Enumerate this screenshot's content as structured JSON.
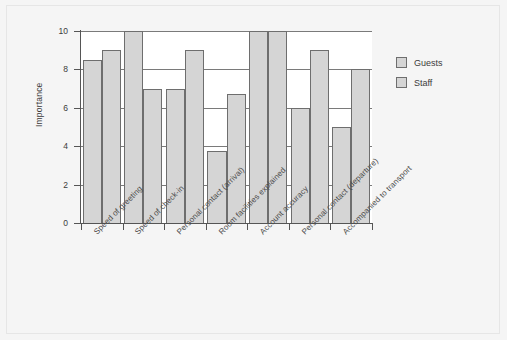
{
  "chart_data": {
    "type": "bar",
    "title": "",
    "xlabel": "",
    "ylabel": "Importance",
    "ylim": [
      0,
      10
    ],
    "ytick_values": [
      0,
      2,
      4,
      6,
      8,
      10
    ],
    "ytick_labels": [
      "0",
      "2",
      "4",
      "6",
      "8",
      "10"
    ],
    "grid": "horizontal",
    "legend_position": "right",
    "categories": [
      "Speed of greeting",
      "Speed of check-in",
      "Personal contact (arrival)",
      "Room facilities explained",
      "Account accuracy",
      "Personal contact (departure)",
      "Accompanied to transport"
    ],
    "series": [
      {
        "name": "Guests",
        "color": "#d5d5d5",
        "values": [
          8.5,
          10,
          7,
          3.75,
          10,
          6,
          5
        ]
      },
      {
        "name": "Staff",
        "color": "#d5d5d5",
        "values": [
          9,
          7,
          9,
          6.7,
          10,
          9,
          8
        ]
      }
    ]
  },
  "legend": {
    "items": [
      {
        "label": "Guests"
      },
      {
        "label": "Staff"
      }
    ]
  },
  "style": {
    "page_background": "#f5f5f5",
    "plot_background": "#ffffff",
    "bar_fill": "#d5d5d5",
    "bar_stroke": "#6e6e6e",
    "axis_color": "#555555",
    "grid_color": "#7a7a7a"
  }
}
